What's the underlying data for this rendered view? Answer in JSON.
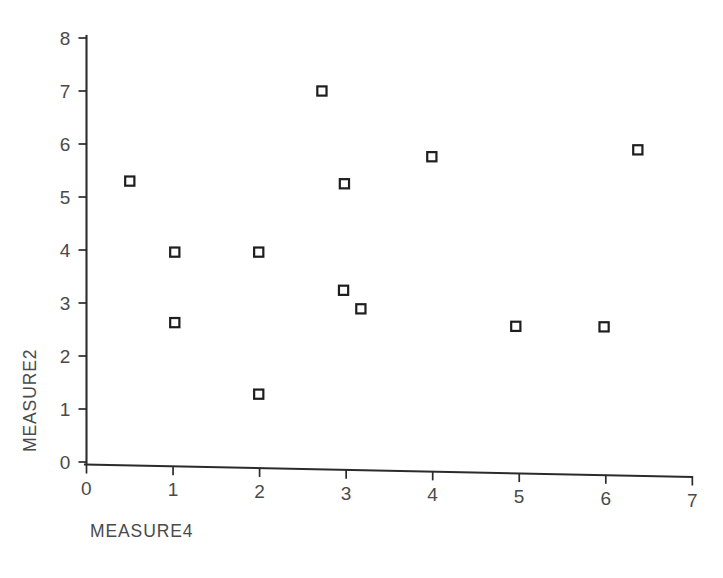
{
  "chart_data": {
    "type": "scatter",
    "title": "",
    "xlabel": "MEASURE4",
    "ylabel": "MEASURE2",
    "xlim": [
      0,
      7
    ],
    "ylim": [
      0,
      8
    ],
    "xticks": [
      0,
      1,
      2,
      3,
      4,
      5,
      6,
      7
    ],
    "yticks": [
      0,
      1,
      2,
      3,
      4,
      5,
      6,
      7,
      8
    ],
    "xtick_labels": [
      "0",
      "1",
      "2",
      "3",
      "4",
      "5",
      "6",
      "7"
    ],
    "ytick_labels": [
      "0",
      "1",
      "2",
      "3",
      "4",
      "5",
      "6",
      "7",
      "8"
    ],
    "grid": false,
    "legend": null,
    "marker": "open-square",
    "marker_color": "#1e1e1e",
    "marker_fill": "#ffffff",
    "points": [
      {
        "x": 0.5,
        "y": 5.3
      },
      {
        "x": 1.02,
        "y": 3.96
      },
      {
        "x": 1.02,
        "y": 2.63
      },
      {
        "x": 1.99,
        "y": 3.96
      },
      {
        "x": 1.99,
        "y": 1.28
      },
      {
        "x": 2.72,
        "y": 7.0
      },
      {
        "x": 2.98,
        "y": 5.25
      },
      {
        "x": 2.97,
        "y": 3.24
      },
      {
        "x": 3.17,
        "y": 2.89
      },
      {
        "x": 3.99,
        "y": 5.76
      },
      {
        "x": 4.96,
        "y": 2.56
      },
      {
        "x": 5.98,
        "y": 2.55
      },
      {
        "x": 6.37,
        "y": 5.89
      }
    ]
  },
  "axes": {
    "x_label": "MEASURE4",
    "y_label": "MEASURE2"
  }
}
